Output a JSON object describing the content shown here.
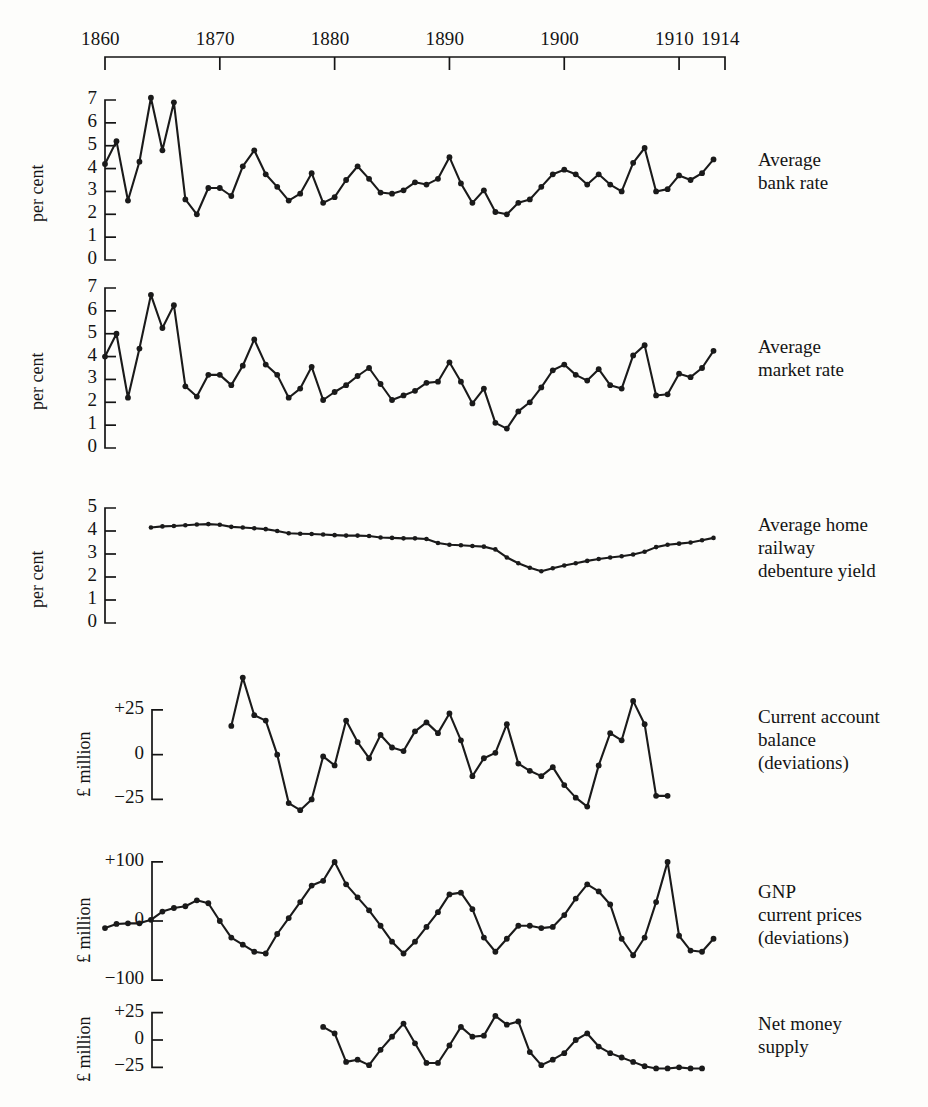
{
  "figure": {
    "x_axis": {
      "label": "",
      "ticks": [
        {
          "year": 1860,
          "label": "1860"
        },
        {
          "year": 1870,
          "label": "1870"
        },
        {
          "year": 1880,
          "label": "1880"
        },
        {
          "year": 1890,
          "label": "1890"
        },
        {
          "year": 1900,
          "label": "1900"
        },
        {
          "year": 1910,
          "label": "1910"
        },
        {
          "year": 1914,
          "label": "1914"
        }
      ],
      "range": [
        1860,
        1914
      ]
    }
  },
  "chart_data": [
    {
      "type": "line",
      "panel": 1,
      "title": "Average\nbank rate",
      "label_lines": [
        "Average",
        "bank rate"
      ],
      "ylabel": "per cent",
      "ylim": [
        0,
        7
      ],
      "yticks": [
        0,
        1,
        2,
        3,
        4,
        5,
        6,
        7
      ],
      "ytick_labels": [
        "0",
        "1",
        "2",
        "3",
        "4",
        "5",
        "6",
        "7"
      ],
      "xlabel": "",
      "grid": false,
      "x": [
        1860,
        1861,
        1862,
        1863,
        1864,
        1865,
        1866,
        1867,
        1868,
        1869,
        1870,
        1871,
        1872,
        1873,
        1874,
        1875,
        1876,
        1877,
        1878,
        1879,
        1880,
        1881,
        1882,
        1883,
        1884,
        1885,
        1886,
        1887,
        1888,
        1889,
        1890,
        1891,
        1892,
        1893,
        1894,
        1895,
        1896,
        1897,
        1898,
        1899,
        1900,
        1901,
        1902,
        1903,
        1904,
        1905,
        1906,
        1907,
        1908,
        1909,
        1910,
        1911,
        1912,
        1913
      ],
      "values": [
        4.2,
        5.2,
        2.6,
        4.3,
        7.1,
        4.8,
        6.9,
        2.65,
        2.0,
        3.15,
        3.15,
        2.8,
        4.1,
        4.8,
        3.75,
        3.2,
        2.6,
        2.9,
        3.8,
        2.5,
        2.75,
        3.5,
        4.1,
        3.55,
        2.95,
        2.9,
        3.05,
        3.4,
        3.3,
        3.55,
        4.5,
        3.35,
        2.5,
        3.05,
        2.1,
        2.0,
        2.5,
        2.65,
        3.2,
        3.75,
        3.95,
        3.75,
        3.3,
        3.75,
        3.3,
        3.0,
        4.25,
        4.9,
        3.0,
        3.1,
        3.7,
        3.5,
        3.8,
        4.4
      ]
    },
    {
      "type": "line",
      "panel": 2,
      "title": "Average\nmarket rate",
      "label_lines": [
        "Average",
        "market rate"
      ],
      "ylabel": "per cent",
      "ylim": [
        0,
        7
      ],
      "yticks": [
        0,
        1,
        2,
        3,
        4,
        5,
        6,
        7
      ],
      "ytick_labels": [
        "0",
        "1",
        "2",
        "3",
        "4",
        "5",
        "6",
        "7"
      ],
      "xlabel": "",
      "grid": false,
      "x": [
        1860,
        1861,
        1862,
        1863,
        1864,
        1865,
        1866,
        1867,
        1868,
        1869,
        1870,
        1871,
        1872,
        1873,
        1874,
        1875,
        1876,
        1877,
        1878,
        1879,
        1880,
        1881,
        1882,
        1883,
        1884,
        1885,
        1886,
        1887,
        1888,
        1889,
        1890,
        1891,
        1892,
        1893,
        1894,
        1895,
        1896,
        1897,
        1898,
        1899,
        1900,
        1901,
        1902,
        1903,
        1904,
        1905,
        1906,
        1907,
        1908,
        1909,
        1910,
        1911,
        1912,
        1913
      ],
      "values": [
        4.0,
        5.0,
        2.2,
        4.35,
        6.7,
        5.25,
        6.25,
        2.7,
        2.25,
        3.2,
        3.2,
        2.75,
        3.6,
        4.75,
        3.65,
        3.2,
        2.2,
        2.6,
        3.55,
        2.1,
        2.45,
        2.75,
        3.15,
        3.5,
        2.8,
        2.1,
        2.3,
        2.5,
        2.85,
        2.9,
        3.75,
        2.9,
        1.95,
        2.6,
        1.1,
        0.85,
        1.6,
        2.0,
        2.65,
        3.4,
        3.65,
        3.2,
        2.95,
        3.45,
        2.75,
        2.6,
        4.05,
        4.5,
        2.3,
        2.35,
        3.25,
        3.1,
        3.5,
        4.25
      ]
    },
    {
      "type": "line",
      "panel": 3,
      "title": "Average home\nrailway\ndebenture yield",
      "label_lines": [
        "Average home",
        "railway",
        "debenture yield"
      ],
      "ylabel": "per cent",
      "ylim": [
        0,
        5
      ],
      "yticks": [
        0,
        1,
        2,
        3,
        4,
        5
      ],
      "ytick_labels": [
        "0",
        "1",
        "2",
        "3",
        "4",
        "5"
      ],
      "xlabel": "",
      "grid": false,
      "x": [
        1864,
        1865,
        1866,
        1867,
        1868,
        1869,
        1870,
        1871,
        1872,
        1873,
        1874,
        1875,
        1876,
        1877,
        1878,
        1879,
        1880,
        1881,
        1882,
        1883,
        1884,
        1885,
        1886,
        1887,
        1888,
        1889,
        1890,
        1891,
        1892,
        1893,
        1894,
        1895,
        1896,
        1897,
        1898,
        1899,
        1900,
        1901,
        1902,
        1903,
        1904,
        1905,
        1906,
        1907,
        1908,
        1909,
        1910,
        1911,
        1912,
        1913
      ],
      "values": [
        4.15,
        4.2,
        4.22,
        4.25,
        4.28,
        4.3,
        4.27,
        4.18,
        4.15,
        4.12,
        4.08,
        4.0,
        3.9,
        3.88,
        3.87,
        3.85,
        3.82,
        3.8,
        3.8,
        3.78,
        3.72,
        3.7,
        3.68,
        3.68,
        3.65,
        3.48,
        3.4,
        3.38,
        3.35,
        3.32,
        3.2,
        2.85,
        2.6,
        2.4,
        2.25,
        2.38,
        2.5,
        2.6,
        2.7,
        2.78,
        2.85,
        2.9,
        2.98,
        3.1,
        3.3,
        3.4,
        3.45,
        3.5,
        3.6,
        3.7
      ]
    },
    {
      "type": "line",
      "panel": 4,
      "title": "Current account\nbalance\n(deviations)",
      "label_lines": [
        "Current account",
        "balance",
        "(deviations)"
      ],
      "ylabel": "£ million",
      "ylim": [
        -32,
        45
      ],
      "yticks": [
        -25,
        0,
        25
      ],
      "ytick_labels": [
        "−25",
        "0",
        "+25"
      ],
      "xlabel": "",
      "grid": false,
      "x": [
        1871,
        1872,
        1873,
        1874,
        1875,
        1876,
        1877,
        1878,
        1879,
        1880,
        1881,
        1882,
        1883,
        1884,
        1885,
        1886,
        1887,
        1888,
        1889,
        1890,
        1891,
        1892,
        1893,
        1894,
        1895,
        1896,
        1897,
        1898,
        1899,
        1900,
        1901,
        1902,
        1903,
        1904,
        1905,
        1906,
        1907,
        1908,
        1909
      ],
      "values": [
        16,
        43,
        22,
        19,
        0,
        -27,
        -31,
        -25,
        -1,
        -6,
        19,
        7,
        -2,
        11,
        4,
        2,
        13,
        18,
        12,
        23,
        8,
        -12,
        -2,
        1,
        17,
        -5,
        -9,
        -12,
        -7,
        -17,
        -24,
        -29,
        -6,
        12,
        8,
        30,
        17,
        -23,
        -23
      ]
    },
    {
      "type": "line",
      "panel": 5,
      "title": "GNP\ncurrent prices\n(deviations)",
      "label_lines": [
        "GNP",
        "current prices",
        "(deviations)"
      ],
      "ylabel": "£ million",
      "ylim": [
        -110,
        110
      ],
      "yticks": [
        -100,
        0,
        100
      ],
      "ytick_labels": [
        "−100",
        "0",
        "+100"
      ],
      "xlabel": "",
      "grid": false,
      "x": [
        1860,
        1861,
        1862,
        1863,
        1864,
        1865,
        1866,
        1867,
        1868,
        1869,
        1870,
        1871,
        1872,
        1873,
        1874,
        1875,
        1876,
        1877,
        1878,
        1879,
        1880,
        1881,
        1882,
        1883,
        1884,
        1885,
        1886,
        1887,
        1888,
        1889,
        1890,
        1891,
        1892,
        1893,
        1894,
        1895,
        1896,
        1897,
        1898,
        1899,
        1900,
        1901,
        1902,
        1903,
        1904,
        1905,
        1906,
        1907,
        1908,
        1909,
        1910,
        1911,
        1912,
        1913
      ],
      "values": [
        -12,
        -5,
        -4,
        -4,
        2,
        16,
        22,
        25,
        35,
        30,
        0,
        -28,
        -40,
        -52,
        -55,
        -22,
        5,
        32,
        60,
        68,
        100,
        62,
        40,
        18,
        -8,
        -35,
        -55,
        -35,
        -10,
        15,
        45,
        48,
        20,
        -28,
        -52,
        -30,
        -8,
        -8,
        -12,
        -10,
        10,
        38,
        62,
        50,
        28,
        -30,
        -58,
        -28,
        32,
        100,
        -25,
        -50,
        -52,
        -30
      ]
    },
    {
      "type": "line",
      "panel": 6,
      "title": "Net money\nsupply",
      "label_lines": [
        "Net money",
        "supply"
      ],
      "ylabel": "£ million",
      "ylim": [
        -32,
        32
      ],
      "yticks": [
        -25,
        0,
        25
      ],
      "ytick_labels": [
        "−25",
        "0",
        "+25"
      ],
      "xlabel": "",
      "grid": false,
      "x": [
        1879,
        1880,
        1881,
        1882,
        1883,
        1884,
        1885,
        1886,
        1887,
        1888,
        1889,
        1890,
        1891,
        1892,
        1893,
        1894,
        1895,
        1896,
        1897,
        1898,
        1899,
        1900,
        1901,
        1902,
        1903,
        1904,
        1905,
        1906,
        1907,
        1908,
        1909,
        1910,
        1911,
        1912
      ],
      "values": [
        12,
        6,
        -20,
        -18,
        -23,
        -9,
        3,
        15,
        -3,
        -21,
        -21,
        -5,
        12,
        3,
        4,
        22,
        14,
        17,
        -11,
        -23,
        -18,
        -12,
        0,
        6,
        -6,
        -12,
        -16,
        -20,
        -24,
        -26,
        -26,
        -25,
        -26,
        -26
      ]
    }
  ]
}
